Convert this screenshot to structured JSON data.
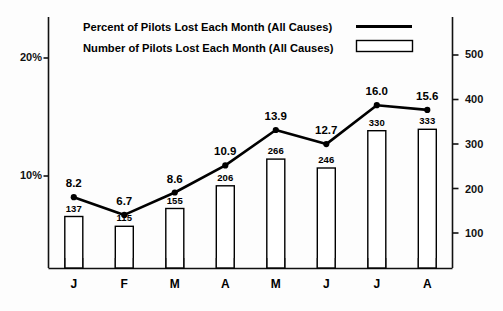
{
  "chart_data": {
    "type": "bar",
    "title": "",
    "subtitle": "",
    "xlabel": "",
    "categories": [
      "J",
      "F",
      "M",
      "A",
      "M",
      "J",
      "J",
      "A"
    ],
    "grid": false,
    "legend_position": "top",
    "left_axis": {
      "label": "",
      "ticks": [
        "20%",
        "10%"
      ],
      "tick_values": [
        20,
        10
      ],
      "range": [
        0,
        22.5
      ]
    },
    "right_axis": {
      "label": "",
      "ticks": [
        "500",
        "400",
        "300",
        "200",
        "100"
      ],
      "tick_values": [
        500,
        400,
        300,
        200,
        100
      ],
      "range": [
        0,
        595
      ]
    },
    "series": [
      {
        "name": "Percent of Pilots Lost Each Month (All Causes)",
        "type": "line",
        "axis": "left",
        "marker": "dot",
        "color": "#000000",
        "values": [
          8.2,
          6.7,
          8.6,
          10.9,
          13.9,
          12.7,
          16.0,
          15.6
        ],
        "labels": [
          "8.2",
          "6.7",
          "8.6",
          "10.9",
          "13.9",
          "12.7",
          "16.0",
          "15.6"
        ]
      },
      {
        "name": "Number of Pilots Lost Each Month (All Causes)",
        "type": "bar",
        "axis": "right",
        "color": "#ffffff",
        "edge_color": "#000000",
        "values": [
          137,
          115,
          155,
          206,
          266,
          246,
          330,
          333
        ],
        "labels": [
          "137",
          "115",
          "155",
          "206",
          "266",
          "246",
          "330",
          "333"
        ]
      }
    ]
  },
  "legend": {
    "entries": [
      {
        "label": "Percent of Pilots Lost Each Month (All Causes)",
        "swatch": "line-swatch"
      },
      {
        "label": "Number of Pilots Lost Each Month (All Causes)",
        "swatch": "bar-swatch"
      }
    ]
  }
}
